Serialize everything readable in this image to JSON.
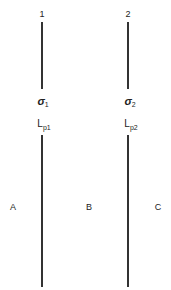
{
  "diagram": {
    "boundaries": [
      {
        "number": "1",
        "stress_symbol": "σ",
        "stress_subscript": "1",
        "length_label": "L",
        "length_subscript": "p1"
      },
      {
        "number": "2",
        "stress_symbol": "σ",
        "stress_subscript": "2",
        "length_label": "L",
        "length_subscript": "p2"
      }
    ],
    "regions": [
      "A",
      "B",
      "C"
    ]
  }
}
